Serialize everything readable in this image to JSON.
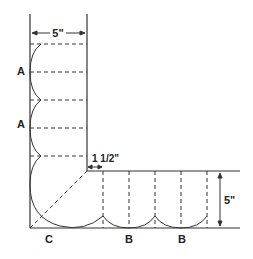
{
  "diagram": {
    "dimensions": {
      "top_width": "5\"",
      "right_height": "5\"",
      "offset": "1 1/2\""
    },
    "labels": {
      "a1": "A",
      "a2": "A",
      "c": "C",
      "b1": "B",
      "b2": "B"
    },
    "colors": {
      "line": "#333333",
      "background": "#ffffff"
    }
  }
}
